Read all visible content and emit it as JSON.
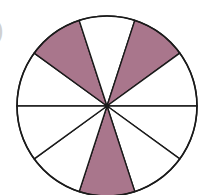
{
  "diagram": {
    "type": "fraction-circle",
    "sectors_total": 10,
    "shaded_indices": [
      1,
      3,
      7
    ],
    "shaded_fraction": "3/10",
    "colors": {
      "shaded": "#a9768c",
      "unshaded": "#ffffff",
      "stroke": "#1a1a1a"
    },
    "center": [
      107,
      106
    ],
    "radius": 90,
    "start_angle_deg": 180
  },
  "stray_mark": ")"
}
